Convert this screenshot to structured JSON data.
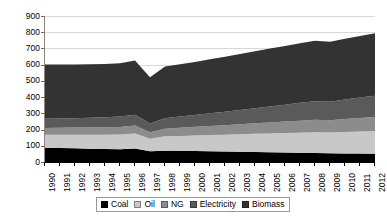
{
  "chart_data": {
    "type": "area",
    "stacked": true,
    "title": "",
    "xlabel": "",
    "ylabel": "Mtoe",
    "ylim": [
      0,
      900
    ],
    "ytick_step": 100,
    "yticks": [
      "900",
      "800",
      "700",
      "600",
      "500",
      "400",
      "300",
      "200",
      "100",
      "0"
    ],
    "grid": "horizontal",
    "legend_position": "bottom",
    "categories": [
      "1990",
      "1991",
      "1992",
      "1993",
      "1994",
      "1995",
      "1996",
      "1997",
      "1998",
      "1999",
      "2000",
      "2001",
      "2002",
      "2003",
      "2004",
      "2005",
      "2006",
      "2007",
      "2008",
      "2009",
      "2010",
      "2011",
      "2012"
    ],
    "series": [
      {
        "name": "Coal",
        "color": "#000000",
        "values": [
          88,
          86,
          84,
          82,
          80,
          79,
          83,
          66,
          70,
          69,
          68,
          66,
          64,
          63,
          62,
          60,
          58,
          57,
          56,
          54,
          53,
          52,
          51
        ]
      },
      {
        "name": "Oil",
        "color": "#c8c8c8",
        "values": [
          80,
          82,
          84,
          86,
          88,
          90,
          93,
          78,
          88,
          92,
          96,
          100,
          104,
          108,
          112,
          116,
          120,
          124,
          128,
          128,
          132,
          136,
          140
        ]
      },
      {
        "name": "NG",
        "color": "#8c8c8c",
        "values": [
          42,
          43,
          44,
          45,
          46,
          47,
          49,
          40,
          47,
          50,
          53,
          56,
          59,
          62,
          65,
          68,
          71,
          74,
          76,
          76,
          80,
          83,
          86
        ]
      },
      {
        "name": "Electricity",
        "color": "#5a5a5a",
        "values": [
          56,
          57,
          58,
          60,
          62,
          64,
          67,
          54,
          65,
          69,
          73,
          78,
          83,
          88,
          93,
          98,
          104,
          110,
          115,
          114,
          120,
          126,
          132
        ]
      },
      {
        "name": "Biomass",
        "color": "#333333",
        "values": [
          335,
          333,
          331,
          330,
          328,
          328,
          333,
          285,
          318,
          322,
          327,
          333,
          339,
          345,
          351,
          357,
          362,
          367,
          372,
          370,
          375,
          380,
          385
        ]
      }
    ],
    "legend_entries": [
      {
        "label": "Coal",
        "color": "#000000"
      },
      {
        "label": "Oil",
        "color": "#c8c8c8"
      },
      {
        "label": "NG",
        "color": "#8c8c8c"
      },
      {
        "label": "Electricity",
        "color": "#5a5a5a"
      },
      {
        "label": "Biomass",
        "color": "#333333"
      }
    ]
  }
}
